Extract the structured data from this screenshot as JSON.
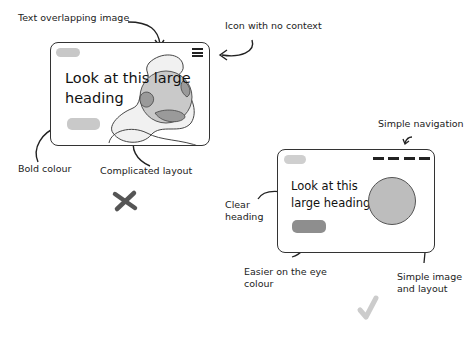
{
  "bad_example": {
    "annotations": {
      "text_overlap": "Text overlapping image",
      "icon_context": "Icon with no context",
      "bold_colour": "Bold colour",
      "complicated": "Complicated layout"
    },
    "card": {
      "heading_line1": "Look at this large",
      "heading_line2": "heading",
      "logo_color": "#c8c8c8",
      "button_color": "#c9c9c9",
      "icon": "hamburger-menu-icon"
    },
    "verdict": "cross-mark"
  },
  "good_example": {
    "annotations": {
      "navigation": "Simple navigation",
      "clear_heading_1": "Clear",
      "clear_heading_2": "heading",
      "easier_colour_1": "Easier on the eye",
      "easier_colour_2": "colour",
      "simple_image_1": "Simple image",
      "simple_image_2": "and layout"
    },
    "card": {
      "heading_line1": "Look at this",
      "heading_line2": "large heading",
      "logo_color": "#cfcfcf",
      "button_color": "#8e8e8e",
      "circle_color": "#bdbdbd"
    },
    "verdict": "check-mark"
  },
  "colors": {
    "outline": "#333333",
    "cross": "#555555",
    "check": "#cccccc"
  }
}
